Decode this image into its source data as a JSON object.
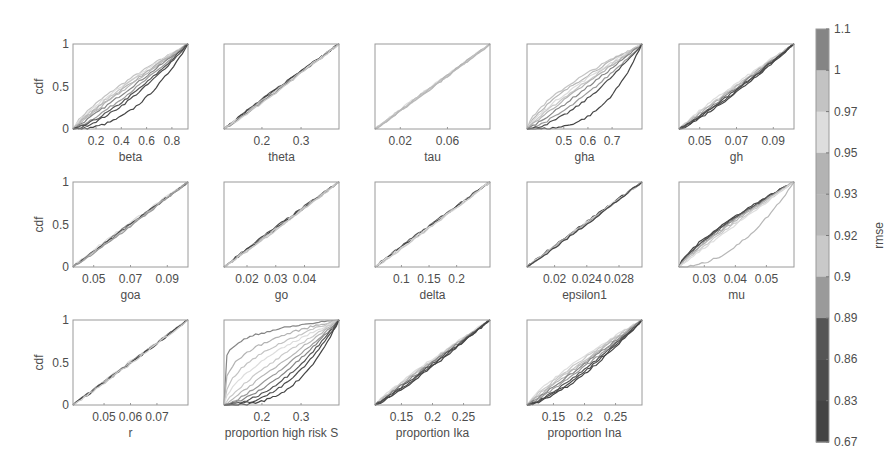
{
  "chart_data": {
    "type": "line",
    "title": "",
    "ylabel": "cdf",
    "ylim": [
      0,
      1
    ],
    "yticks": [
      "0",
      "0.5",
      "1"
    ],
    "grid": false,
    "legend_position": "none",
    "colorbar": {
      "label": "rmse",
      "ticks": [
        "1.1",
        "1",
        "0.97",
        "0.95",
        "0.93",
        "0.92",
        "0.9",
        "0.89",
        "0.86",
        "0.83",
        "0.67"
      ],
      "band_colors": [
        "#858585",
        "#c3c3c3",
        "#dddddd",
        "#b3b3b3",
        "#b7b7b7",
        "#c9c9c9",
        "#9a9a9a",
        "#555555",
        "#4c4c4c",
        "#444444"
      ]
    },
    "subplots": [
      {
        "xlabel": "beta",
        "xticks": [
          "0.2",
          "0.4",
          "0.6",
          "0.8"
        ],
        "tick_pos": [
          0.2,
          0.42,
          0.64,
          0.86
        ],
        "curves": [
          {
            "e": 0.75,
            "c": 1
          },
          {
            "e": 0.8,
            "c": 2
          },
          {
            "e": 0.85,
            "c": 5
          },
          {
            "e": 0.9,
            "c": 3
          },
          {
            "e": 0.95,
            "c": 4
          },
          {
            "e": 1.05,
            "c": 0
          },
          {
            "e": 1.2,
            "c": 6
          },
          {
            "e": 1.35,
            "c": 7
          },
          {
            "e": 1.5,
            "c": 8
          },
          {
            "e": 2.2,
            "c": 9
          }
        ]
      },
      {
        "xlabel": "theta",
        "xticks": [
          "0.2",
          "0.3"
        ],
        "tick_pos": [
          0.33,
          0.67
        ],
        "curves": [
          {
            "e": 0.95,
            "c": 7
          },
          {
            "e": 0.97,
            "c": 9
          },
          {
            "e": 1.0,
            "c": 4
          },
          {
            "e": 1.02,
            "c": 2
          },
          {
            "e": 1.04,
            "c": 0
          },
          {
            "e": 1.06,
            "c": 5
          }
        ]
      },
      {
        "xlabel": "tau",
        "xticks": [
          "0.02",
          "0.06"
        ],
        "tick_pos": [
          0.22,
          0.63
        ],
        "curves": [
          {
            "e": 0.97,
            "c": 2
          },
          {
            "e": 0.99,
            "c": 5
          },
          {
            "e": 1.0,
            "c": 3
          },
          {
            "e": 1.01,
            "c": 1
          },
          {
            "e": 1.03,
            "c": 4
          }
        ]
      },
      {
        "xlabel": "gha",
        "xticks": [
          "0.5",
          "0.6",
          "0.7"
        ],
        "tick_pos": [
          0.32,
          0.53,
          0.74
        ],
        "curves": [
          {
            "e": 0.65,
            "c": 1
          },
          {
            "e": 0.72,
            "c": 4
          },
          {
            "e": 0.8,
            "c": 2
          },
          {
            "e": 0.88,
            "c": 5
          },
          {
            "e": 0.95,
            "c": 3
          },
          {
            "e": 1.1,
            "c": 0
          },
          {
            "e": 1.35,
            "c": 6
          },
          {
            "e": 1.6,
            "c": 8
          },
          {
            "e": 3.0,
            "c": 9
          }
        ]
      },
      {
        "xlabel": "gh",
        "xticks": [
          "0.05",
          "0.07",
          "0.09"
        ],
        "tick_pos": [
          0.18,
          0.5,
          0.82
        ],
        "curves": [
          {
            "e": 0.9,
            "c": 2
          },
          {
            "e": 0.95,
            "c": 5
          },
          {
            "e": 1.0,
            "c": 3
          },
          {
            "e": 1.05,
            "c": 0
          },
          {
            "e": 1.1,
            "c": 7
          },
          {
            "e": 1.15,
            "c": 8
          },
          {
            "e": 1.2,
            "c": 9
          }
        ]
      },
      {
        "xlabel": "goa",
        "xticks": [
          "0.05",
          "0.07",
          "0.09"
        ],
        "tick_pos": [
          0.18,
          0.5,
          0.82
        ],
        "curves": [
          {
            "e": 0.93,
            "c": 2
          },
          {
            "e": 0.97,
            "c": 0
          },
          {
            "e": 1.0,
            "c": 8
          },
          {
            "e": 1.03,
            "c": 4
          },
          {
            "e": 1.06,
            "c": 6
          }
        ]
      },
      {
        "xlabel": "go",
        "xticks": [
          "0.02",
          "0.03",
          "0.04"
        ],
        "tick_pos": [
          0.2,
          0.45,
          0.7
        ],
        "curves": [
          {
            "e": 0.95,
            "c": 8
          },
          {
            "e": 0.98,
            "c": 3
          },
          {
            "e": 1.0,
            "c": 9
          },
          {
            "e": 1.02,
            "c": 5
          },
          {
            "e": 1.04,
            "c": 1
          }
        ]
      },
      {
        "xlabel": "delta",
        "xticks": [
          "0.1",
          "0.15",
          "0.2"
        ],
        "tick_pos": [
          0.23,
          0.47,
          0.71
        ],
        "curves": [
          {
            "e": 0.96,
            "c": 7
          },
          {
            "e": 0.99,
            "c": 3
          },
          {
            "e": 1.0,
            "c": 9
          },
          {
            "e": 1.02,
            "c": 2
          },
          {
            "e": 1.04,
            "c": 5
          }
        ]
      },
      {
        "xlabel": "epsilon1",
        "xticks": [
          "0.02",
          "0.024",
          "0.028"
        ],
        "tick_pos": [
          0.24,
          0.52,
          0.8
        ],
        "curves": [
          {
            "e": 0.96,
            "c": 8
          },
          {
            "e": 0.99,
            "c": 2
          },
          {
            "e": 1.0,
            "c": 6
          },
          {
            "e": 1.02,
            "c": 4
          },
          {
            "e": 1.04,
            "c": 9
          }
        ]
      },
      {
        "xlabel": "mu",
        "xticks": [
          "0.03",
          "0.04",
          "0.05"
        ],
        "tick_pos": [
          0.22,
          0.49,
          0.76
        ],
        "curves": [
          {
            "e": 0.72,
            "c": 9
          },
          {
            "e": 0.75,
            "c": 8
          },
          {
            "e": 0.78,
            "c": 7
          },
          {
            "e": 0.82,
            "c": 6
          },
          {
            "e": 0.86,
            "c": 3
          },
          {
            "e": 0.92,
            "c": 5
          },
          {
            "e": 0.98,
            "c": 2
          },
          {
            "e": 2.0,
            "c": 4
          }
        ]
      },
      {
        "xlabel": "r",
        "xticks": [
          "0.05",
          "0.06",
          "0.07"
        ],
        "tick_pos": [
          0.27,
          0.5,
          0.73
        ],
        "curves": [
          {
            "e": 0.96,
            "c": 2
          },
          {
            "e": 0.99,
            "c": 7
          },
          {
            "e": 1.0,
            "c": 4
          },
          {
            "e": 1.02,
            "c": 9
          },
          {
            "e": 1.04,
            "c": 5
          }
        ]
      },
      {
        "xlabel": "proportion high risk S",
        "xticks": [
          "0.2",
          "0.3"
        ],
        "tick_pos": [
          0.33,
          0.67
        ],
        "curves": [
          {
            "e": 0.15,
            "c": 0
          },
          {
            "e": 0.3,
            "c": 3
          },
          {
            "e": 0.45,
            "c": 1
          },
          {
            "e": 0.6,
            "c": 2
          },
          {
            "e": 0.8,
            "c": 5
          },
          {
            "e": 1.0,
            "c": 4
          },
          {
            "e": 1.25,
            "c": 6
          },
          {
            "e": 1.5,
            "c": 0
          },
          {
            "e": 1.8,
            "c": 7
          },
          {
            "e": 2.2,
            "c": 8
          },
          {
            "e": 2.8,
            "c": 9
          }
        ]
      },
      {
        "xlabel": "proportion Ika",
        "xticks": [
          "0.15",
          "0.2",
          "0.25"
        ],
        "tick_pos": [
          0.23,
          0.5,
          0.77
        ],
        "curves": [
          {
            "e": 0.88,
            "c": 2
          },
          {
            "e": 0.92,
            "c": 5
          },
          {
            "e": 0.96,
            "c": 3
          },
          {
            "e": 1.0,
            "c": 0
          },
          {
            "e": 1.05,
            "c": 7
          },
          {
            "e": 1.1,
            "c": 8
          },
          {
            "e": 1.15,
            "c": 9
          }
        ]
      },
      {
        "xlabel": "proportion Ina",
        "xticks": [
          "0.15",
          "0.2",
          "0.25"
        ],
        "tick_pos": [
          0.23,
          0.5,
          0.77
        ],
        "curves": [
          {
            "e": 0.8,
            "c": 2
          },
          {
            "e": 0.86,
            "c": 5
          },
          {
            "e": 0.92,
            "c": 1
          },
          {
            "e": 0.98,
            "c": 3
          },
          {
            "e": 1.05,
            "c": 0
          },
          {
            "e": 1.15,
            "c": 6
          },
          {
            "e": 1.25,
            "c": 7
          },
          {
            "e": 1.35,
            "c": 8
          },
          {
            "e": 1.45,
            "c": 9
          }
        ]
      }
    ]
  },
  "layout": {
    "axes_width": 115,
    "axes_height": 85,
    "col_lefts": [
      73,
      224,
      375,
      527,
      679
    ],
    "row_tops": [
      44,
      182,
      320
    ],
    "colorbar": {
      "x": 816,
      "y": 29,
      "w": 13,
      "h": 413
    }
  }
}
